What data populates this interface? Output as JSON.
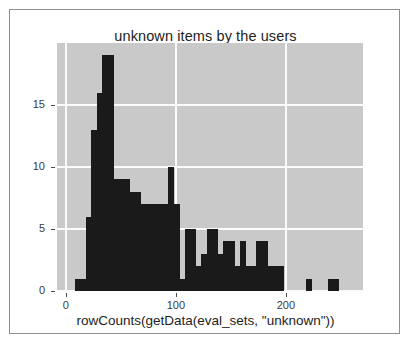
{
  "figure": {
    "title": "unknown items by the users",
    "xlabel": "rowCounts(getData(eval_sets, \"unknown\"))",
    "ylabel": "count",
    "panel_bg": "#c9c9c9",
    "grid_color": "#fbfbfb",
    "bar_color": "#1a1a1a",
    "border_color": "#8f8f8f"
  },
  "axes": {
    "x_ticks": [
      "0",
      "100",
      "200"
    ],
    "x_tick_values": [
      0,
      100,
      200
    ],
    "y_ticks": [
      "0",
      "5",
      "10",
      "15"
    ],
    "y_tick_values": [
      0,
      5,
      10,
      15
    ]
  },
  "chart_data": {
    "type": "bar",
    "title": "unknown items by the users",
    "xlabel": "rowCounts(getData(eval_sets, \"unknown\"))",
    "ylabel": "count",
    "xlim": [
      -8,
      270
    ],
    "ylim": [
      0,
      20
    ],
    "grid": true,
    "legend": null,
    "bin_width": 5,
    "bins": [
      {
        "x0": 8,
        "x1": 13,
        "value": 1
      },
      {
        "x0": 13,
        "x1": 18,
        "value": 1
      },
      {
        "x0": 18,
        "x1": 23,
        "value": 6
      },
      {
        "x0": 23,
        "x1": 28,
        "value": 13
      },
      {
        "x0": 28,
        "x1": 33,
        "value": 16
      },
      {
        "x0": 33,
        "x1": 38,
        "value": 19
      },
      {
        "x0": 38,
        "x1": 43,
        "value": 19
      },
      {
        "x0": 43,
        "x1": 48,
        "value": 9
      },
      {
        "x0": 48,
        "x1": 53,
        "value": 9
      },
      {
        "x0": 53,
        "x1": 58,
        "value": 9
      },
      {
        "x0": 58,
        "x1": 63,
        "value": 8
      },
      {
        "x0": 63,
        "x1": 68,
        "value": 8
      },
      {
        "x0": 68,
        "x1": 73,
        "value": 7
      },
      {
        "x0": 73,
        "x1": 78,
        "value": 7
      },
      {
        "x0": 78,
        "x1": 83,
        "value": 7
      },
      {
        "x0": 83,
        "x1": 88,
        "value": 7
      },
      {
        "x0": 88,
        "x1": 93,
        "value": 7
      },
      {
        "x0": 93,
        "x1": 98,
        "value": 10
      },
      {
        "x0": 98,
        "x1": 103,
        "value": 7
      },
      {
        "x0": 103,
        "x1": 108,
        "value": 1
      },
      {
        "x0": 108,
        "x1": 113,
        "value": 5
      },
      {
        "x0": 113,
        "x1": 118,
        "value": 5
      },
      {
        "x0": 118,
        "x1": 123,
        "value": 2
      },
      {
        "x0": 123,
        "x1": 128,
        "value": 3
      },
      {
        "x0": 128,
        "x1": 133,
        "value": 5
      },
      {
        "x0": 133,
        "x1": 138,
        "value": 5
      },
      {
        "x0": 138,
        "x1": 143,
        "value": 3
      },
      {
        "x0": 143,
        "x1": 148,
        "value": 4
      },
      {
        "x0": 148,
        "x1": 153,
        "value": 4
      },
      {
        "x0": 153,
        "x1": 158,
        "value": 2
      },
      {
        "x0": 158,
        "x1": 163,
        "value": 4
      },
      {
        "x0": 163,
        "x1": 168,
        "value": 2
      },
      {
        "x0": 168,
        "x1": 173,
        "value": 2
      },
      {
        "x0": 173,
        "x1": 178,
        "value": 4
      },
      {
        "x0": 178,
        "x1": 183,
        "value": 4
      },
      {
        "x0": 183,
        "x1": 188,
        "value": 2
      },
      {
        "x0": 188,
        "x1": 193,
        "value": 2
      },
      {
        "x0": 193,
        "x1": 198,
        "value": 2
      },
      {
        "x0": 198,
        "x1": 203,
        "value": 0
      },
      {
        "x0": 218,
        "x1": 223,
        "value": 1
      },
      {
        "x0": 238,
        "x1": 243,
        "value": 1
      },
      {
        "x0": 243,
        "x1": 248,
        "value": 1
      }
    ]
  }
}
